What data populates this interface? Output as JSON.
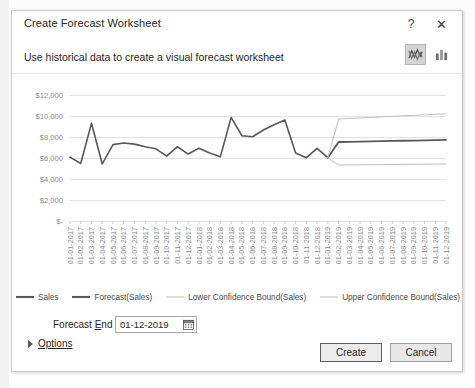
{
  "window": {
    "title": "Create Forecast Worksheet",
    "help_icon": "question-mark-icon",
    "help_label": "?",
    "close_icon": "close-icon",
    "close_label": "✕"
  },
  "header": {
    "subtitle": "Use historical data to create a visual forecast worksheet",
    "chart_type_buttons": [
      {
        "name": "line-chart-type-button",
        "icon": "line-chart-icon",
        "selected": true
      },
      {
        "name": "column-chart-type-button",
        "icon": "column-chart-icon",
        "selected": false
      }
    ]
  },
  "form": {
    "forecast_end_label_pre": "Forecast ",
    "forecast_end_label_key": "E",
    "forecast_end_label_post": "nd",
    "forecast_end_value": "01-12-2019",
    "calendar_icon": "calendar-icon",
    "options_label": "Options",
    "options_expander_icon": "triangle-right-icon",
    "options_expanded": false
  },
  "footer": {
    "create_label": "Create",
    "cancel_label": "Cancel"
  },
  "colors": {
    "sales": "#595959",
    "forecast": "#595959",
    "lower_bound": "#bfbfbf",
    "upper_bound": "#bfbfbf",
    "gridline": "#e2e2e2",
    "axis_text": "#8a8a8a",
    "dialog_border": "#c9c9c9",
    "selected_button_bg": "#d4d4d4"
  },
  "chart_data": {
    "type": "line",
    "title": "",
    "xlabel": "",
    "ylabel": "",
    "ylim": [
      0,
      13000
    ],
    "grid": true,
    "legend_position": "bottom",
    "ytick_labels": [
      "$12,000",
      "$10,000",
      "$8,000",
      "$6,000",
      "$4,000",
      "$2,000",
      "$-"
    ],
    "ytick_values": [
      12000,
      10000,
      8000,
      6000,
      4000,
      2000,
      0
    ],
    "categories": [
      "01-01-2017",
      "01-02-2017",
      "01-03-2017",
      "01-04-2017",
      "01-05-2017",
      "01-06-2017",
      "01-07-2017",
      "01-08-2017",
      "01-09-2017",
      "01-10-2017",
      "01-11-2017",
      "01-12-2017",
      "01-01-2018",
      "01-02-2018",
      "01-03-2018",
      "01-04-2018",
      "01-05-2018",
      "01-06-2018",
      "01-07-2018",
      "01-08-2018",
      "01-09-2018",
      "01-10-2018",
      "01-11-2018",
      "01-12-2018",
      "01-01-2019",
      "01-02-2019",
      "01-03-2019",
      "01-04-2019",
      "01-05-2019",
      "01-06-2019",
      "01-07-2019",
      "01-08-2019",
      "01-09-2019",
      "01-10-2019",
      "01-11-2019",
      "01-12-2019"
    ],
    "series": [
      {
        "name": "Sales",
        "color": "#595959",
        "width": 1.6,
        "values": [
          6100,
          5500,
          9350,
          5450,
          7300,
          7450,
          7350,
          7100,
          6900,
          6200,
          7100,
          6400,
          6950,
          6500,
          6150,
          9900,
          8150,
          8050,
          8700,
          9200,
          9650,
          6500,
          6050,
          6950,
          6050,
          null,
          null,
          null,
          null,
          null,
          null,
          null,
          null,
          null,
          null,
          null
        ]
      },
      {
        "name": "Forecast(Sales)",
        "color": "#595959",
        "width": 1.8,
        "values": [
          null,
          null,
          null,
          null,
          null,
          null,
          null,
          null,
          null,
          null,
          null,
          null,
          null,
          null,
          null,
          null,
          null,
          null,
          null,
          null,
          null,
          null,
          null,
          null,
          6050,
          7550,
          7570,
          7590,
          7610,
          7630,
          7650,
          7670,
          7690,
          7710,
          7730,
          7750
        ]
      },
      {
        "name": "Lower Confidence Bound(Sales)",
        "color": "#bfbfbf",
        "width": 1.0,
        "values": [
          null,
          null,
          null,
          null,
          null,
          null,
          null,
          null,
          null,
          null,
          null,
          null,
          null,
          null,
          null,
          null,
          null,
          null,
          null,
          null,
          null,
          null,
          null,
          null,
          6050,
          5350,
          5360,
          5370,
          5380,
          5390,
          5400,
          5410,
          5420,
          5430,
          5440,
          5450
        ]
      },
      {
        "name": "Upper Confidence Bound(Sales)",
        "color": "#bfbfbf",
        "width": 1.0,
        "values": [
          null,
          null,
          null,
          null,
          null,
          null,
          null,
          null,
          null,
          null,
          null,
          null,
          null,
          null,
          null,
          null,
          null,
          null,
          null,
          null,
          null,
          null,
          null,
          null,
          6050,
          9750,
          9800,
          9850,
          9900,
          9950,
          10000,
          10050,
          10100,
          10150,
          10200,
          10250
        ]
      }
    ]
  }
}
